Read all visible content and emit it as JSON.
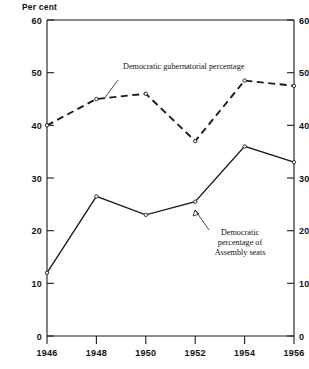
{
  "chart_data": {
    "type": "line",
    "title": "",
    "xlabel": "",
    "ylabel": "Per cent",
    "ylabel_text": "Per cent",
    "xlim": [
      1946,
      1956
    ],
    "ylim": [
      0,
      60
    ],
    "grid": false,
    "legend_position": "inline-annotations",
    "yticks": [
      0,
      10,
      20,
      30,
      40,
      50,
      60
    ],
    "ytick_labels": [
      "0",
      "10",
      "20",
      "30",
      "40",
      "50",
      "60"
    ],
    "right_axis_mirrored": true,
    "right_ytick_labels": [
      "0",
      "10",
      "20",
      "30",
      "40",
      "50",
      "60"
    ],
    "xticks": [
      1946,
      1948,
      1950,
      1952,
      1954,
      1956
    ],
    "xtick_labels": [
      "1946",
      "1948",
      "1950",
      "1952",
      "1954",
      "1956"
    ],
    "categories": [
      1946,
      1948,
      1950,
      1952,
      1954,
      1956
    ],
    "series": [
      {
        "name": "Democratic gubernatorial percentage",
        "style": "dashed",
        "values": [
          40,
          45,
          46,
          37,
          48.5,
          47.5
        ]
      },
      {
        "name": "Democratic percentage of Assembly seats",
        "style": "solid",
        "values": [
          12,
          26.5,
          23,
          25.5,
          36,
          33
        ]
      }
    ],
    "annotations": [
      {
        "id": "gubernatorial-label",
        "text": "Democratic gubernatorial percentage",
        "lines": [
          "Democratic gubernatorial percentage"
        ],
        "align": "left",
        "points_to": [
          1948,
          45
        ]
      },
      {
        "id": "assembly-label",
        "text": "Democratic percentage of Assembly seats",
        "lines": [
          "Democratic",
          "percentage of",
          "Assembly seats"
        ],
        "align": "center",
        "points_to": [
          1953,
          30
        ]
      }
    ]
  },
  "axes": {
    "y_axis_title": "Per cent",
    "left_ticks": [
      "60",
      "50",
      "40",
      "30",
      "20",
      "10",
      "0"
    ],
    "right_ticks": [
      "60",
      "50",
      "40",
      "30",
      "20",
      "10",
      "0"
    ],
    "x_ticks": [
      "1946",
      "1948",
      "1950",
      "1952",
      "1954",
      "1956"
    ]
  },
  "labels": {
    "gubernatorial": "Democratic gubernatorial percentage",
    "assembly_line1": "Democratic",
    "assembly_line2": "percentage of",
    "assembly_line3": "Assembly seats"
  },
  "colors": {
    "ink": "#1a1a1a",
    "background": "#ffffff"
  }
}
